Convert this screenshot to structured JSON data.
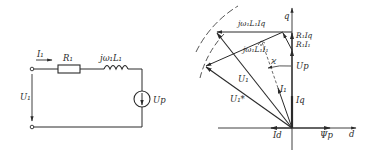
{
  "circuit": {
    "current_label": "I₁",
    "resistor_label": "R₁",
    "inductor_label": "jω₁L₁",
    "voltage_label": "U₁",
    "source_label": "Up"
  },
  "phasor": {
    "axes": {
      "q": "q",
      "d": "d"
    },
    "labels": {
      "jwL1Iq": "jω₁L₁Iq",
      "jwL1I1": "jω₁L₁I₁",
      "R1Iq": "R₁Iq",
      "R1I1": "R₁I₁",
      "angle": "ϰ",
      "Up": "Up",
      "U1": "U₁",
      "U1star": "U₁*",
      "I1": "I₁",
      "Iq": "Iq",
      "Id": "Id",
      "Psip": "Ψp"
    },
    "colors": {
      "line": "#2a2a2a",
      "background": "#ffffff"
    }
  }
}
